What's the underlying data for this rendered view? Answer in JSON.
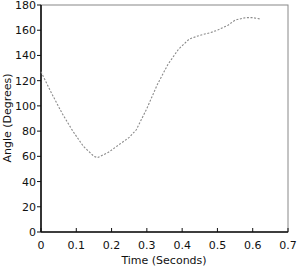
{
  "chart_data": {
    "type": "line",
    "title": "",
    "xlabel": "Time (Seconds)",
    "ylabel": "Angle (Degrees)",
    "xlim": [
      0,
      0.7
    ],
    "ylim": [
      0,
      180
    ],
    "xticks": [
      "0",
      "0.1",
      "0.2",
      "0.3",
      "0.4",
      "0.5",
      "0.6",
      "0.7"
    ],
    "yticks": [
      "0",
      "20",
      "40",
      "60",
      "80",
      "100",
      "120",
      "140",
      "160",
      "180"
    ],
    "grid": false,
    "legend": null,
    "series": [
      {
        "name": "Angle",
        "style": "dotted",
        "color": "#8a8a8a",
        "x": [
          0.0,
          0.03,
          0.06,
          0.09,
          0.12,
          0.15,
          0.16,
          0.19,
          0.22,
          0.25,
          0.27,
          0.3,
          0.33,
          0.36,
          0.39,
          0.42,
          0.45,
          0.48,
          0.5,
          0.53,
          0.55,
          0.58,
          0.6,
          0.62
        ],
        "y": [
          127,
          110,
          94,
          80,
          68,
          60,
          59,
          63,
          69,
          75,
          81,
          98,
          117,
          133,
          145,
          153,
          156,
          158,
          160,
          164,
          168,
          170,
          170,
          169
        ]
      }
    ]
  }
}
